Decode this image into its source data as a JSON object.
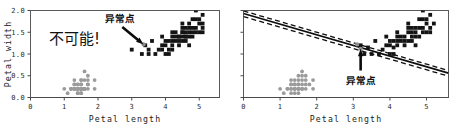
{
  "figure": {
    "width": 460,
    "height": 130,
    "background": "#ffffff",
    "marker_colors": {
      "dark_class": "#141414",
      "gray_class": "#9b9b9b",
      "outlier": "#8e8e8e",
      "axis": "#4a4a4a",
      "frame": "#5a5a5a",
      "boundary": "#0d0d0d"
    }
  },
  "panels": [
    {
      "id": "left-panel",
      "xlabel": "Petal length",
      "ylabel": "Petal width",
      "xticks": [
        "0",
        "1",
        "2",
        "3",
        "4",
        "5"
      ],
      "yticks": [
        "0.0",
        "0.5",
        "1.0",
        "1.5",
        "2.0"
      ],
      "annotation_label": "异常点",
      "note_text": "不可能!",
      "has_boundary": false
    },
    {
      "id": "right-panel",
      "xlabel": "Petal length",
      "ylabel": "",
      "xticks": [
        "0",
        "1",
        "2",
        "3",
        "4",
        "5"
      ],
      "yticks": [
        "",
        "",
        "",
        "",
        ""
      ],
      "annotation_label": "异常点",
      "note_text": "",
      "has_boundary": true
    }
  ],
  "chart_data": {
    "type": "scatter",
    "title": "",
    "xlabel": "Petal length",
    "ylabel": "Petal width",
    "xlim": [
      0,
      5.6
    ],
    "ylim": [
      0.0,
      2.0
    ],
    "xticks": [
      0,
      1,
      2,
      3,
      4,
      5
    ],
    "yticks": [
      0.0,
      0.5,
      1.0,
      1.5,
      2.0
    ],
    "grid": false,
    "legend": "none",
    "panels": [
      {
        "name": "left",
        "annotation": {
          "text": "异常点",
          "points_to": [
            3.35,
            1.22
          ],
          "arrow_from": [
            2.72,
            1.62
          ]
        },
        "note": {
          "text": "不可能!",
          "at": [
            0.55,
            1.22
          ]
        },
        "decision_boundary": null
      },
      {
        "name": "right",
        "annotation": {
          "text": "异常点",
          "points_to": [
            3.2,
            1.12
          ],
          "arrow_from": [
            3.2,
            0.62
          ]
        },
        "decision_boundary": {
          "type": "linear-svm",
          "solid_line": {
            "x": [
              0.0,
              5.6
            ],
            "y": [
              1.93,
              0.56
            ]
          },
          "margin_upper": {
            "x": [
              0.0,
              5.6
            ],
            "y": [
              1.99,
              0.62
            ]
          },
          "margin_lower": {
            "x": [
              0.0,
              5.6
            ],
            "y": [
              1.86,
              0.49
            ]
          }
        }
      }
    ],
    "series": [
      {
        "name": "setosa",
        "marker": "circle",
        "color": "#9b9b9b",
        "points": [
          [
            1.0,
            0.2
          ],
          [
            1.1,
            0.1
          ],
          [
            1.2,
            0.2
          ],
          [
            1.2,
            0.2
          ],
          [
            1.3,
            0.2
          ],
          [
            1.3,
            0.3
          ],
          [
            1.3,
            0.4
          ],
          [
            1.3,
            0.2
          ],
          [
            1.4,
            0.2
          ],
          [
            1.4,
            0.2
          ],
          [
            1.4,
            0.1
          ],
          [
            1.4,
            0.2
          ],
          [
            1.4,
            0.3
          ],
          [
            1.4,
            0.1
          ],
          [
            1.4,
            0.2
          ],
          [
            1.5,
            0.2
          ],
          [
            1.5,
            0.4
          ],
          [
            1.5,
            0.1
          ],
          [
            1.5,
            0.2
          ],
          [
            1.5,
            0.2
          ],
          [
            1.5,
            0.4
          ],
          [
            1.5,
            0.1
          ],
          [
            1.5,
            0.2
          ],
          [
            1.5,
            0.3
          ],
          [
            1.6,
            0.2
          ],
          [
            1.6,
            0.2
          ],
          [
            1.6,
            0.4
          ],
          [
            1.6,
            0.2
          ],
          [
            1.6,
            0.2
          ],
          [
            1.6,
            0.6
          ],
          [
            1.7,
            0.2
          ],
          [
            1.7,
            0.3
          ],
          [
            1.7,
            0.4
          ],
          [
            1.7,
            0.5
          ],
          [
            1.7,
            0.3
          ],
          [
            1.9,
            0.4
          ],
          [
            1.9,
            0.2
          ],
          [
            1.5,
            0.3
          ],
          [
            1.4,
            0.3
          ],
          [
            1.3,
            0.3
          ],
          [
            1.6,
            0.2
          ],
          [
            1.5,
            0.2
          ],
          [
            1.4,
            0.2
          ],
          [
            1.6,
            0.2
          ],
          [
            1.5,
            0.2
          ],
          [
            1.2,
            0.2
          ],
          [
            1.3,
            0.2
          ],
          [
            1.5,
            0.2
          ],
          [
            1.3,
            0.2
          ],
          [
            1.5,
            0.2
          ]
        ]
      },
      {
        "name": "versicolor-virginica",
        "marker": "square",
        "color": "#141414",
        "points": [
          [
            3.3,
            1.0
          ],
          [
            3.5,
            1.0
          ],
          [
            3.6,
            1.3
          ],
          [
            3.7,
            1.0
          ],
          [
            3.8,
            1.1
          ],
          [
            3.9,
            1.2
          ],
          [
            3.9,
            1.4
          ],
          [
            4.0,
            1.0
          ],
          [
            4.0,
            1.3
          ],
          [
            4.1,
            1.0
          ],
          [
            4.1,
            1.3
          ],
          [
            4.2,
            1.2
          ],
          [
            4.2,
            1.3
          ],
          [
            4.2,
            1.5
          ],
          [
            4.3,
            1.3
          ],
          [
            4.4,
            1.2
          ],
          [
            4.4,
            1.4
          ],
          [
            4.4,
            1.4
          ],
          [
            4.5,
            1.3
          ],
          [
            4.5,
            1.5
          ],
          [
            4.5,
            1.5
          ],
          [
            4.5,
            1.6
          ],
          [
            4.5,
            1.7
          ],
          [
            4.6,
            1.3
          ],
          [
            4.6,
            1.4
          ],
          [
            4.6,
            1.5
          ],
          [
            4.7,
            1.2
          ],
          [
            4.7,
            1.4
          ],
          [
            4.7,
            1.6
          ],
          [
            4.8,
            1.4
          ],
          [
            4.8,
            1.8
          ],
          [
            4.9,
            1.5
          ],
          [
            4.9,
            1.8
          ],
          [
            4.9,
            2.0
          ],
          [
            5.0,
            1.5
          ],
          [
            5.0,
            1.7
          ],
          [
            5.1,
            1.5
          ],
          [
            5.1,
            1.6
          ],
          [
            5.1,
            1.9
          ],
          [
            3.0,
            1.1
          ],
          [
            3.4,
            1.2
          ],
          [
            4.0,
            1.2
          ],
          [
            4.3,
            1.4
          ],
          [
            4.6,
            1.4
          ],
          [
            4.8,
            1.6
          ],
          [
            4.4,
            1.3
          ],
          [
            4.5,
            1.4
          ],
          [
            4.7,
            1.5
          ],
          [
            4.9,
            1.6
          ],
          [
            5.0,
            1.8
          ],
          [
            3.9,
            1.1
          ],
          [
            4.1,
            1.1
          ],
          [
            4.2,
            1.1
          ],
          [
            3.5,
            1.1
          ],
          [
            4.3,
            1.5
          ],
          [
            4.6,
            1.6
          ],
          [
            4.7,
            1.7
          ],
          [
            4.8,
            1.5
          ],
          [
            5.1,
            1.7
          ],
          [
            4.2,
            1.4
          ]
        ]
      },
      {
        "name": "outlier",
        "marker": "circle",
        "color": "#8e8e8e",
        "points": [
          [
            3.35,
            1.22
          ]
        ]
      }
    ],
    "right_panel_series": [
      {
        "name": "setosa",
        "marker": "circle",
        "color": "#9b9b9b",
        "points": [
          [
            1.0,
            0.2
          ],
          [
            1.1,
            0.1
          ],
          [
            1.2,
            0.2
          ],
          [
            1.3,
            0.2
          ],
          [
            1.3,
            0.3
          ],
          [
            1.3,
            0.4
          ],
          [
            1.4,
            0.2
          ],
          [
            1.4,
            0.2
          ],
          [
            1.4,
            0.1
          ],
          [
            1.4,
            0.3
          ],
          [
            1.5,
            0.2
          ],
          [
            1.5,
            0.4
          ],
          [
            1.5,
            0.1
          ],
          [
            1.5,
            0.2
          ],
          [
            1.5,
            0.3
          ],
          [
            1.6,
            0.2
          ],
          [
            1.6,
            0.4
          ],
          [
            1.6,
            0.2
          ],
          [
            1.6,
            0.6
          ],
          [
            1.7,
            0.2
          ],
          [
            1.7,
            0.3
          ],
          [
            1.7,
            0.4
          ],
          [
            1.7,
            0.5
          ],
          [
            1.9,
            0.4
          ],
          [
            1.9,
            0.2
          ],
          [
            1.5,
            0.3
          ],
          [
            1.4,
            0.3
          ],
          [
            1.3,
            0.3
          ],
          [
            1.6,
            0.2
          ],
          [
            1.5,
            0.2
          ],
          [
            1.4,
            0.2
          ],
          [
            1.6,
            0.3
          ],
          [
            1.2,
            0.2
          ],
          [
            1.3,
            0.2
          ],
          [
            1.5,
            0.2
          ],
          [
            1.6,
            0.5
          ],
          [
            1.4,
            0.4
          ],
          [
            1.8,
            0.3
          ],
          [
            1.5,
            0.5
          ],
          [
            1.3,
            0.1
          ]
        ]
      },
      {
        "name": "versicolor-virginica",
        "marker": "square",
        "color": "#141414",
        "points": [
          [
            3.3,
            1.0
          ],
          [
            3.5,
            1.0
          ],
          [
            3.6,
            1.3
          ],
          [
            3.7,
            1.0
          ],
          [
            3.8,
            1.1
          ],
          [
            3.9,
            1.2
          ],
          [
            3.9,
            1.4
          ],
          [
            4.0,
            1.0
          ],
          [
            4.0,
            1.3
          ],
          [
            4.1,
            1.0
          ],
          [
            4.1,
            1.3
          ],
          [
            4.2,
            1.2
          ],
          [
            4.2,
            1.3
          ],
          [
            4.2,
            1.5
          ],
          [
            4.3,
            1.3
          ],
          [
            4.4,
            1.2
          ],
          [
            4.4,
            1.4
          ],
          [
            4.5,
            1.3
          ],
          [
            4.5,
            1.5
          ],
          [
            4.5,
            1.6
          ],
          [
            4.5,
            1.7
          ],
          [
            4.6,
            1.3
          ],
          [
            4.6,
            1.4
          ],
          [
            4.6,
            1.5
          ],
          [
            4.7,
            1.2
          ],
          [
            4.7,
            1.4
          ],
          [
            4.7,
            1.6
          ],
          [
            4.8,
            1.4
          ],
          [
            4.8,
            1.8
          ],
          [
            4.9,
            1.5
          ],
          [
            4.9,
            1.8
          ],
          [
            4.9,
            2.0
          ],
          [
            5.0,
            1.5
          ],
          [
            5.0,
            1.7
          ],
          [
            5.1,
            1.5
          ],
          [
            5.1,
            1.6
          ],
          [
            5.1,
            1.9
          ],
          [
            3.2,
            1.2
          ],
          [
            4.3,
            1.4
          ],
          [
            4.6,
            1.6
          ],
          [
            4.4,
            1.3
          ],
          [
            4.7,
            1.5
          ],
          [
            4.9,
            1.6
          ],
          [
            5.0,
            1.8
          ],
          [
            4.2,
            1.4
          ],
          [
            3.4,
            1.15
          ],
          [
            4.0,
            1.2
          ],
          [
            4.1,
            1.15
          ],
          [
            4.8,
            1.6
          ],
          [
            5.2,
            1.7
          ]
        ]
      },
      {
        "name": "outlier",
        "marker": "circle",
        "color": "#8e8e8e",
        "points": [
          [
            3.2,
            1.12
          ],
          [
            3.1,
            1.22
          ]
        ]
      }
    ]
  }
}
